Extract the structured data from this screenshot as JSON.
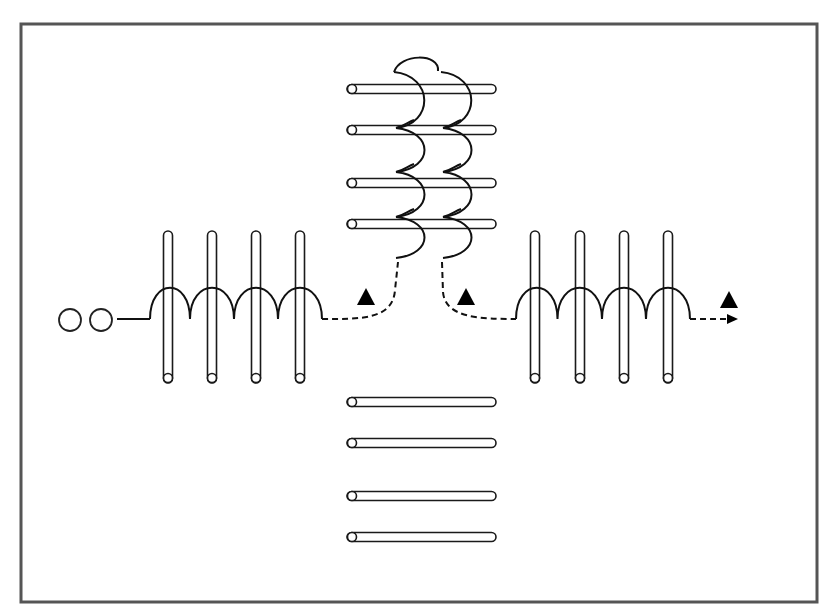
{
  "diagram": {
    "title": "",
    "canvas": {
      "width": 832,
      "height": 615,
      "background": "#ffffff"
    },
    "frame": {
      "x": 21,
      "y": 24,
      "width": 796,
      "height": 578,
      "stroke": "#555555"
    },
    "input_circles": [
      {
        "cx": 70,
        "cy": 320,
        "r": 11
      },
      {
        "cx": 101,
        "cy": 320,
        "r": 11
      }
    ],
    "input_lead": {
      "x1": 117,
      "x2": 150,
      "y": 319
    },
    "left_group": {
      "label": "left-vertical-rods",
      "rods": [
        168,
        212,
        256,
        300
      ],
      "rod_top": 231,
      "rod_bottom": 383,
      "rod_width": 9,
      "coil": {
        "start_x": 150,
        "end_x": 322,
        "base_y": 319,
        "top_y": 287
      }
    },
    "right_group": {
      "label": "right-vertical-rods",
      "rods": [
        535,
        580,
        624,
        668
      ],
      "rod_top": 231,
      "rod_bottom": 383,
      "rod_width": 9,
      "coil": {
        "start_x": 516,
        "end_x": 690,
        "base_y": 319,
        "top_y": 287
      }
    },
    "top_group": {
      "label": "top-horizontal-rods",
      "rods_y": [
        89,
        130,
        183,
        224
      ],
      "rod_left": 347,
      "rod_right": 496,
      "rod_height": 9,
      "coils": [
        {
          "x": 410,
          "lobes_y": [
            83,
            128,
            172,
            217,
            258
          ]
        },
        {
          "x": 457,
          "lobes_y": [
            83,
            128,
            172,
            217,
            258
          ]
        }
      ]
    },
    "bottom_group": {
      "label": "bottom-horizontal-rods",
      "rods_y": [
        402,
        443,
        496,
        537
      ],
      "rod_left": 347,
      "rod_right": 496,
      "rod_height": 9
    },
    "dashed_paths": [
      {
        "name": "left-to-center",
        "d": "M322,319 C360,319 393,320 395,290 L398,262"
      },
      {
        "name": "center-to-right",
        "d": "M442,262 L443,292 C445,318 480,319 516,319"
      },
      {
        "name": "output",
        "d": "M690,319 L728,319"
      }
    ],
    "arrowhead": {
      "x": 737,
      "y": 319
    },
    "triangles": [
      {
        "cx": 366,
        "cy": 297
      },
      {
        "cx": 466,
        "cy": 297
      },
      {
        "cx": 729,
        "cy": 300
      }
    ],
    "colors": {
      "line": "#111111",
      "frame": "#555555",
      "fill": "#ffffff",
      "marker": "#000000"
    }
  }
}
